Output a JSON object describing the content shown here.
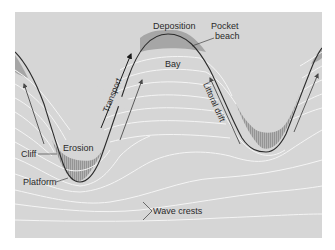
{
  "figure": {
    "colors": {
      "page_bg": "#ffffff",
      "panel_bg": "#d6d6d6",
      "land_bg": "#d2d2d2",
      "coastline": "#2b2b2b",
      "beach_fill": "#a9a9a9",
      "bay_fill": "#c4c4c4",
      "wave_crest": "#f4f4f4",
      "arrow": "#5a5a5a",
      "text": "#2a2a2a"
    },
    "labels": {
      "deposition": "Deposition",
      "pocket_beach_line1": "Pocket",
      "pocket_beach_line2": "beach",
      "bay": "Bay",
      "transport": "Transport",
      "littoral_drift": "Littoral drift",
      "erosion": "Erosion",
      "cliff": "Cliff",
      "platform": "Platform",
      "wave_crests": "Wave crests"
    }
  }
}
